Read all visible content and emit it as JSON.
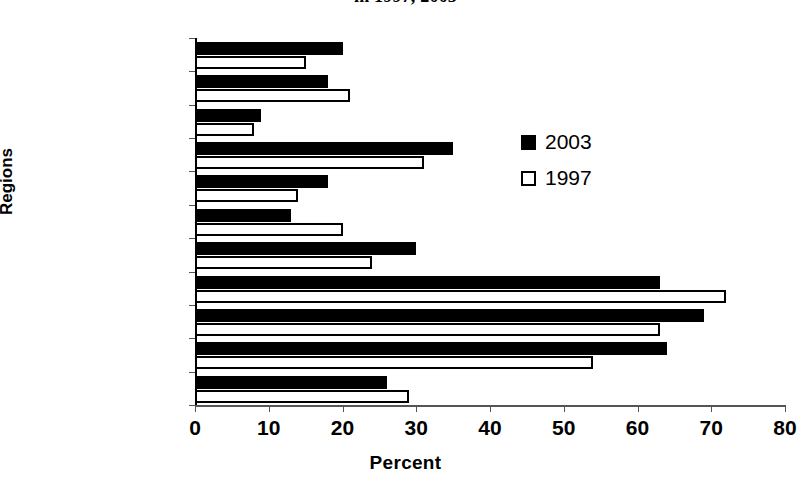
{
  "chart_data": {
    "type": "bar",
    "orientation": "horizontal",
    "title": "in 1997, 2003",
    "title_line1": "",
    "title_line2": "in 1997, 2003",
    "xlabel": "Percent",
    "ylabel": "Regions",
    "xlim": [
      0,
      80
    ],
    "xticks": [
      0,
      10,
      20,
      30,
      40,
      50,
      60,
      70,
      80
    ],
    "grid": false,
    "legend_position": "inside-right",
    "categories": [
      "Western",
      "Central",
      "Gt. Accra",
      "Eastern",
      "Volta",
      "Ashanti",
      "Brong Ahafo",
      "Northern",
      "Upper East",
      "Upper West",
      "Ghana"
    ],
    "series": [
      {
        "name": "2003",
        "color": "#000000",
        "style": "filled",
        "values": [
          20,
          18,
          9,
          35,
          18,
          13,
          30,
          63,
          69,
          64,
          26
        ]
      },
      {
        "name": "1997",
        "color": "#FFFFFF",
        "style": "hollow",
        "values": [
          15,
          21,
          8,
          31,
          14,
          20,
          24,
          72,
          63,
          54,
          29
        ]
      }
    ]
  },
  "legend": {
    "items": [
      {
        "label": "2003",
        "swatch": "filled-square"
      },
      {
        "label": "1997",
        "swatch": "hollow-square"
      }
    ]
  },
  "axis": {
    "x_title": "Percent",
    "y_title": "Regions",
    "x_tick_labels": [
      "0",
      "10",
      "20",
      "30",
      "40",
      "50",
      "60",
      "70",
      "80"
    ]
  }
}
